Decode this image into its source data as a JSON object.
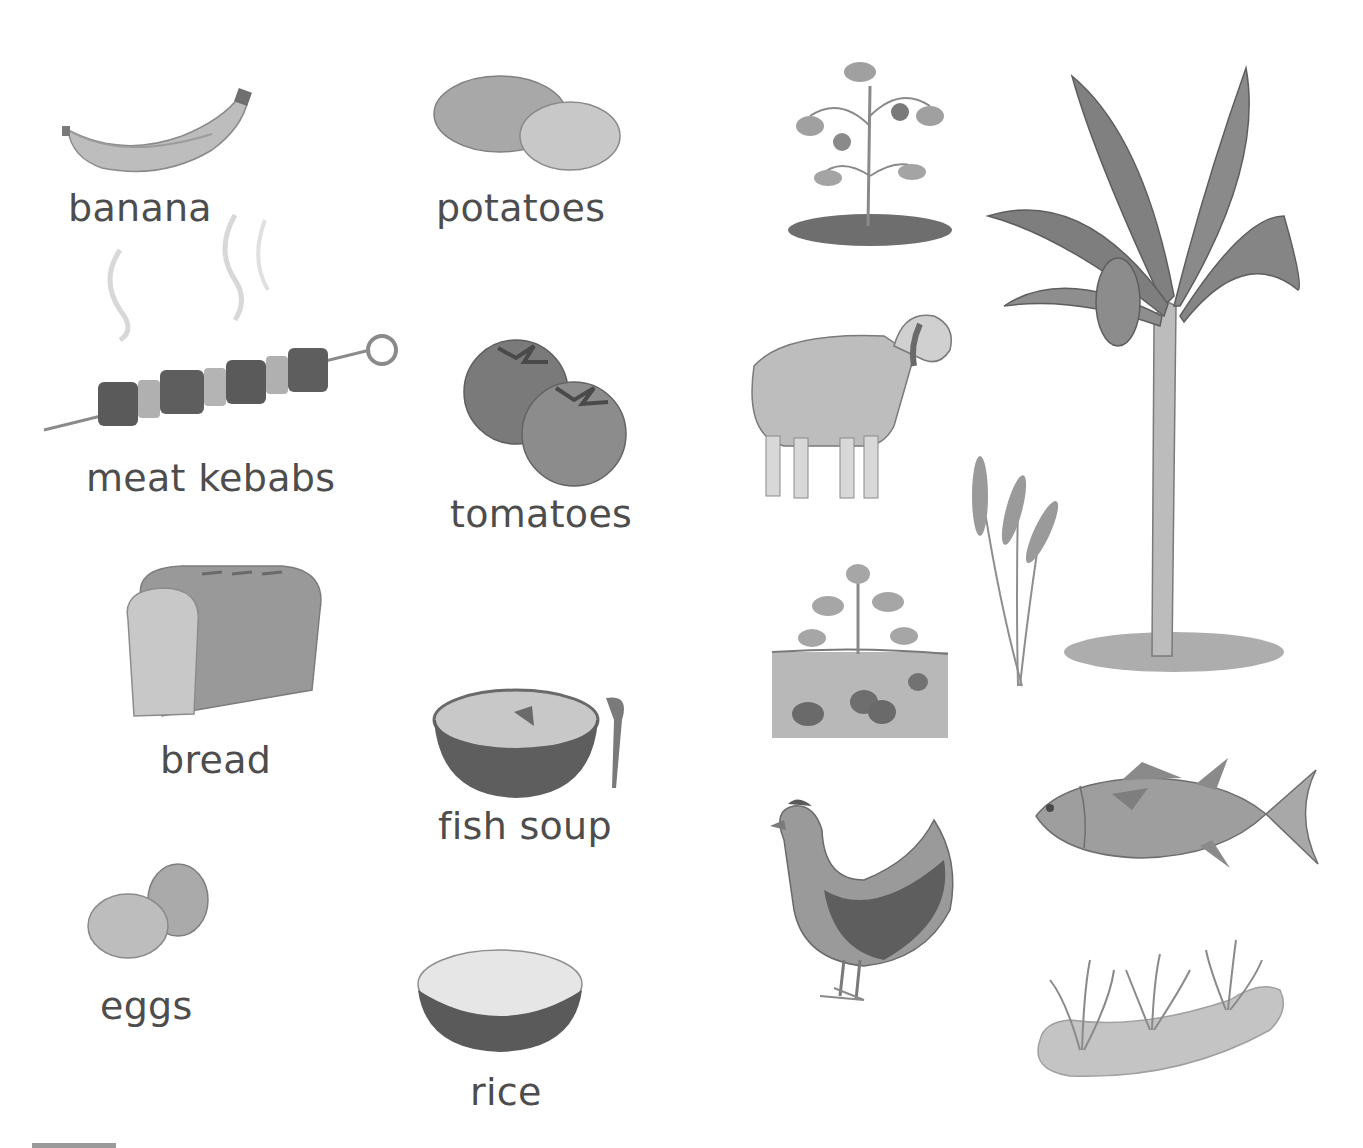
{
  "foods": [
    {
      "label": "banana"
    },
    {
      "label": "potatoes"
    },
    {
      "label": "meat kebabs"
    },
    {
      "label": "tomatoes"
    },
    {
      "label": "bread"
    },
    {
      "label": "fish soup"
    },
    {
      "label": "eggs"
    },
    {
      "label": "rice"
    }
  ],
  "sources": [
    {
      "icon": "tomato-plant-icon"
    },
    {
      "icon": "banana-tree-icon"
    },
    {
      "icon": "sheep-icon"
    },
    {
      "icon": "wheat-icon"
    },
    {
      "icon": "potato-plant-icon"
    },
    {
      "icon": "chicken-icon"
    },
    {
      "icon": "tuna-fish-icon"
    },
    {
      "icon": "rice-paddy-icon"
    }
  ]
}
